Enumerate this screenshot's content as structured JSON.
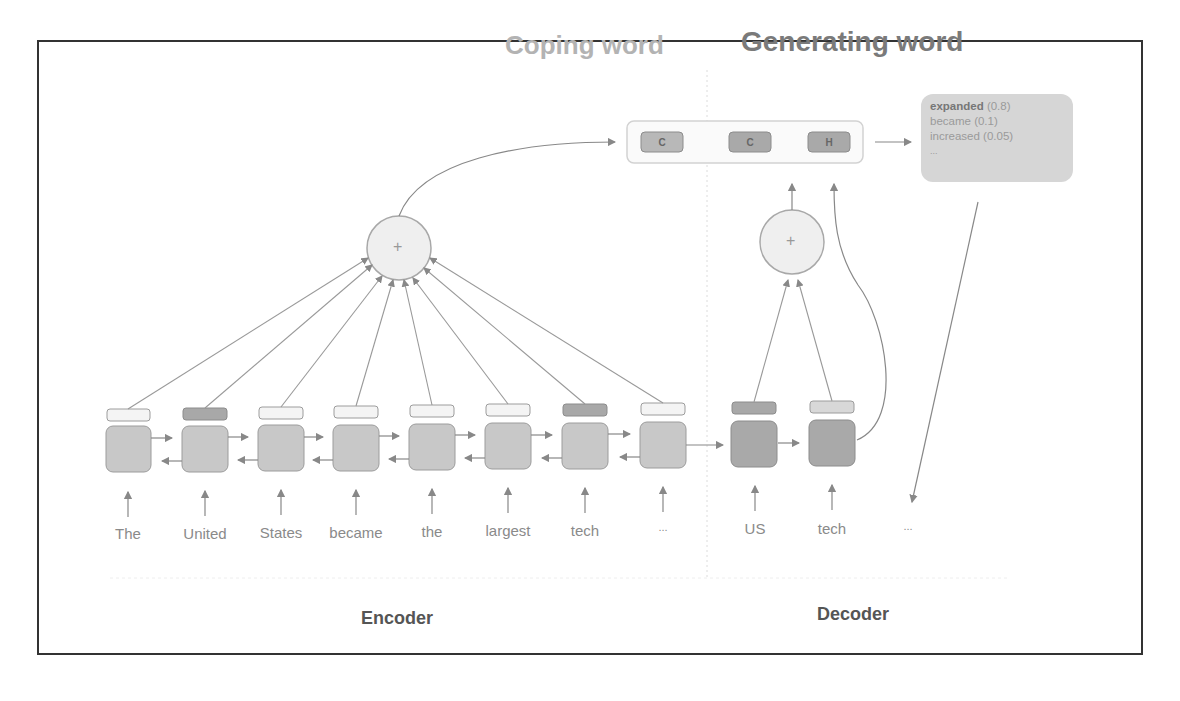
{
  "titles": {
    "copying": "Coping word",
    "generating": "Generating word"
  },
  "pointer_box": {
    "cells": [
      {
        "label": "C",
        "section": "copy"
      },
      {
        "label": "C",
        "section": "generate"
      },
      {
        "label": "H",
        "section": "generate"
      }
    ]
  },
  "distribution": {
    "items": [
      {
        "word": "expanded",
        "prob": "(0.8)",
        "bold": true
      },
      {
        "word": "became",
        "prob": "(0.1)",
        "bold": false
      },
      {
        "word": "increased",
        "prob": "(0.05)",
        "bold": false
      },
      {
        "word": "...",
        "prob": "",
        "bold": false
      }
    ]
  },
  "encoder": {
    "label": "Encoder",
    "tokens": [
      "The",
      "United",
      "States",
      "became",
      "the",
      "largest",
      "tech",
      "..."
    ],
    "attention_highlight": [
      false,
      true,
      false,
      false,
      false,
      false,
      true,
      false
    ]
  },
  "decoder": {
    "label": "Decoder",
    "tokens": [
      "US",
      "tech",
      "..."
    ]
  },
  "attention_symbol": "+",
  "colors": {
    "frame": "#333333",
    "cell_fill": "#c8c8c8",
    "decoder_cell_fill": "#a9a9a9",
    "highlight_bar": "#a8a8a8",
    "plain_bar": "#f4f4f4",
    "stroke": "#8c8c8c"
  }
}
